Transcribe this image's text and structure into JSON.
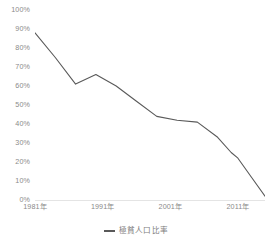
{
  "chart_data": {
    "type": "line",
    "title": "",
    "xlabel": "",
    "ylabel": "",
    "grid": false,
    "legend_position": "bottom-center",
    "line_color": "#595959",
    "axis_label_color": "#8a8a8a",
    "xlim": [
      1981,
      2015
    ],
    "ylim": [
      0,
      100
    ],
    "y_ticks": [
      "0%",
      "10%",
      "20%",
      "30%",
      "40%",
      "50%",
      "60%",
      "70%",
      "80%",
      "90%",
      "100%"
    ],
    "y_tick_values": [
      0,
      10,
      20,
      30,
      40,
      50,
      60,
      70,
      80,
      90,
      100
    ],
    "x_ticks": [
      "1981年",
      "1991年",
      "2001年",
      "2011年"
    ],
    "x_tick_values": [
      1981,
      1991,
      2001,
      2011
    ],
    "series": [
      {
        "name": "極貧人口比率",
        "x": [
          1981,
          1984,
          1987,
          1990,
          1993,
          1996,
          1999,
          2002,
          2005,
          2008,
          2010,
          2011,
          2012,
          2013,
          2015
        ],
        "values": [
          88,
          75,
          61,
          66,
          60,
          52,
          44,
          42,
          41,
          33,
          25,
          22,
          17,
          12,
          2
        ]
      }
    ]
  },
  "legend": {
    "label": "極貧人口比率"
  }
}
